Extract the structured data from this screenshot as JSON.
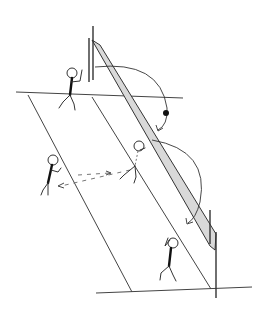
{
  "diagram": {
    "colors": {
      "lines": "#444444",
      "net_fill": "#d9d9d9",
      "ball": "#111111",
      "background": "#ffffff"
    },
    "elements": {
      "players": [
        {
          "id": "player-top-left",
          "position": "behind net, far side"
        },
        {
          "id": "player-left",
          "position": "back court, near side"
        },
        {
          "id": "player-setter",
          "position": "near net, near side"
        },
        {
          "id": "player-bottom",
          "position": "front court, near side"
        }
      ],
      "ball_count": 1,
      "arcs": 2,
      "dashed_paths": 2
    }
  }
}
